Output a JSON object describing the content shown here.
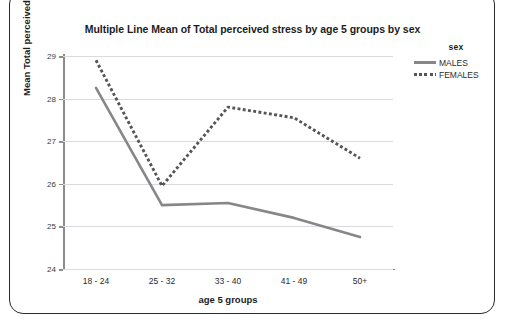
{
  "page_text": "graphs is provided later in this chapter.",
  "chart_data": {
    "type": "line",
    "title": "Multiple Line Mean of Total perceived stress by age 5 groups by sex",
    "xlabel": "age 5 groups",
    "ylabel": "Mean Total perceived stress",
    "categories": [
      "18 - 24",
      "25 - 32",
      "33 - 40",
      "41 - 49",
      "50+"
    ],
    "ylim": [
      24,
      29
    ],
    "yticks": [
      24,
      25,
      26,
      27,
      28,
      29
    ],
    "ytick_labels": [
      "24",
      "25",
      "26",
      "27",
      "28",
      "29"
    ],
    "grid": true,
    "legend_position": "top-right",
    "legend_title": "sex",
    "series": [
      {
        "name": "MALES",
        "style": "solid",
        "color": "#878787",
        "values": [
          28.25,
          25.5,
          25.55,
          25.2,
          24.75
        ]
      },
      {
        "name": "FEMALES",
        "style": "dotted",
        "color": "#555555",
        "values": [
          28.9,
          25.95,
          27.8,
          27.55,
          26.6
        ]
      }
    ]
  }
}
